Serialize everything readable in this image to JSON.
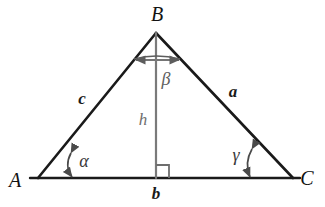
{
  "figure": {
    "kind": "triangle-geometry-diagram",
    "background_color": "#ffffff",
    "stroke_color": "#1a1a1a",
    "accent_gray": "#6e6e6e"
  },
  "vertices": [
    {
      "name": "A",
      "label": "A",
      "x": 38,
      "y": 178,
      "label_x": 15,
      "label_y": 180
    },
    {
      "name": "B",
      "label": "B",
      "x": 156,
      "y": 33,
      "label_x": 157,
      "label_y": 14
    },
    {
      "name": "C",
      "label": "C",
      "x": 293,
      "y": 178,
      "label_x": 307,
      "label_y": 178
    }
  ],
  "sides": [
    {
      "name": "side-c",
      "label": "c",
      "from": "A",
      "to": "B",
      "label_x": 82,
      "label_y": 98,
      "color": "#1a1a1a"
    },
    {
      "name": "side-a",
      "label": "a",
      "from": "B",
      "to": "C",
      "label_x": 233,
      "label_y": 91,
      "color": "#1a1a1a"
    },
    {
      "name": "side-b",
      "label": "b",
      "from": "A",
      "to": "C",
      "label_x": 156,
      "label_y": 193,
      "color": "#1a1a1a"
    }
  ],
  "altitude": {
    "name": "altitude-h",
    "label": "h",
    "from_x": 156,
    "from_y": 33,
    "to_x": 156,
    "to_y": 178,
    "label_x": 143,
    "label_y": 119,
    "color": "#7a7a7a",
    "foot_x": 156,
    "foot_y": 178
  },
  "right_angle": {
    "name": "right-angle-marker",
    "x": 156,
    "y": 178,
    "size": 13,
    "side": "right",
    "color": "#6e6e6e"
  },
  "angles": [
    {
      "name": "angle-alpha",
      "label": "α",
      "at_vertex": "A",
      "label_x": 84,
      "label_y": 161,
      "color": "#3a3a3a",
      "arc_x": 70,
      "arc_top_y": 151,
      "arc_bottom_y": 178
    },
    {
      "name": "angle-beta",
      "label": "β",
      "at_vertex": "B",
      "label_x": 166,
      "label_y": 79,
      "color": "#5d5d5d",
      "arc_y": 60,
      "arc_left_x": 133,
      "arc_right_x": 181
    },
    {
      "name": "angle-gamma",
      "label": "γ",
      "at_vertex": "C",
      "label_x": 236,
      "label_y": 155,
      "color": "#3a3a3a",
      "arc_x": 250,
      "arc_top_y": 147,
      "arc_bottom_y": 178
    }
  ]
}
